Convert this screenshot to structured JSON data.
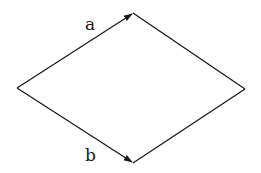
{
  "diagram": {
    "type": "parallelogram-vectors",
    "vertices": {
      "left": [
        17,
        88
      ],
      "top": [
        133,
        13
      ],
      "right": [
        245,
        89
      ],
      "bottom": [
        133,
        163
      ]
    },
    "vectors": [
      {
        "label": "a",
        "from": "left",
        "to": "top",
        "arrow": true
      },
      {
        "label": "b",
        "from": "left",
        "to": "bottom",
        "arrow": true
      }
    ],
    "edges": [
      {
        "from": "top",
        "to": "right"
      },
      {
        "from": "bottom",
        "to": "right"
      }
    ],
    "stroke_color": "#1a1a1a",
    "background": "#ffffff"
  }
}
